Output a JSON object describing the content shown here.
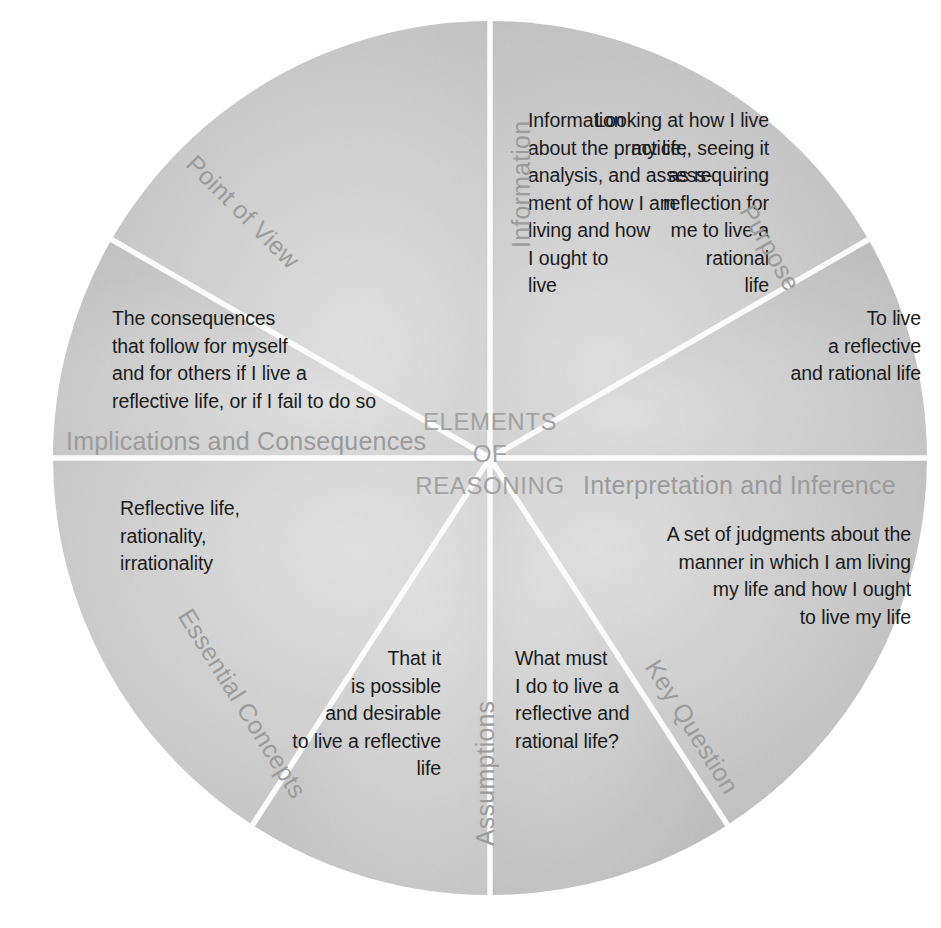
{
  "diagram": {
    "title": "ELEMENTS\nOF\nREASONING",
    "center_color": "#a2a2a2",
    "label_color": "#9b9b9b",
    "body_text_color": "#1b1b1b",
    "divider_color": "#ffffff",
    "segments": [
      {
        "id": "point-of-view",
        "label": "Point of View",
        "text": "Looking at how I live\nmy life, seeing it\nas requiring\nreflection for\nme to live a\nrational\nlife",
        "fill": "#cfcfcf",
        "align": "right"
      },
      {
        "id": "information",
        "label": "Information",
        "text": "Information\nabout the practice,\nanalysis, and assess-\nment of how I am\nliving and how\nI ought to\nlive",
        "fill": "#c9c9c9",
        "align": "left"
      },
      {
        "id": "purpose",
        "label": "Purpose",
        "text": "To live\na reflective\nand rational life",
        "fill": "#c4c4c4",
        "align": "right"
      },
      {
        "id": "implications-and-consequences",
        "label": "Implications and Consequences",
        "text": "The consequences\nthat follow for myself\nand for others if I live a\nreflective life, or if I fail to do so",
        "fill": "#cbcbcb",
        "align": "left"
      },
      {
        "id": "interpretation-and-inference",
        "label": "Interpretation and Inference",
        "text": "A set of judgments about the\nmanner in which I am living\nmy life and how I ought\nto live my life",
        "fill": "#c7c7c7",
        "align": "right"
      },
      {
        "id": "essential-concepts",
        "label": "Essential Concepts",
        "text": "Reflective life,\nrationality,\nirrationality",
        "fill": "#cdcdcd",
        "align": "left"
      },
      {
        "id": "assumptions",
        "label": "Assumptions",
        "text": "That it\nis possible\nand desirable\nto live a reflective\nlife",
        "fill": "#c6c6c6",
        "align": "right"
      },
      {
        "id": "key-question",
        "label": "Key Question",
        "text": "What must\nI do to live a\nreflective and\nrational life?",
        "fill": "#c2c2c2",
        "align": "left"
      }
    ]
  }
}
